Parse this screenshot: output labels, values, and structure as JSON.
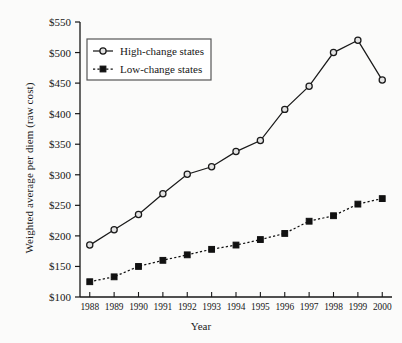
{
  "chart_data": {
    "type": "line",
    "title": "",
    "xlabel": "Year",
    "ylabel": "Weighted average per diem (raw cost)",
    "x": [
      1988,
      1989,
      1990,
      1991,
      1992,
      1993,
      1994,
      1995,
      1996,
      1997,
      1998,
      1999,
      2000
    ],
    "categories": [
      "1988",
      "1989",
      "1990",
      "1991",
      "1992",
      "1993",
      "1994",
      "1995",
      "1996",
      "1997",
      "1998",
      "1999",
      "2000"
    ],
    "series": [
      {
        "name": "High-change states",
        "values": [
          185,
          210,
          235,
          269,
          301,
          313,
          338,
          356,
          407,
          445,
          500,
          520,
          455
        ],
        "marker": "open-circle",
        "linestyle": "solid",
        "color": "#1a1a1a"
      },
      {
        "name": "Low-change states",
        "values": [
          125,
          133,
          150,
          160,
          169,
          178,
          185,
          194,
          204,
          224,
          233,
          252,
          261
        ],
        "marker": "filled-square",
        "linestyle": "dashed",
        "color": "#111111"
      }
    ],
    "ylim": [
      100,
      550
    ],
    "ytick_values": [
      100,
      150,
      200,
      250,
      300,
      350,
      400,
      450,
      500,
      550
    ],
    "ytick_labels": [
      "$100",
      "$150",
      "$200",
      "$250",
      "$300",
      "$350",
      "$400",
      "$450",
      "$500",
      "$550"
    ],
    "xlim": [
      1987.6,
      2000.4
    ],
    "grid": false,
    "legend_position": "upper-left"
  },
  "legend": {
    "entries": [
      {
        "label": "High-change states"
      },
      {
        "label": "Low-change states"
      }
    ]
  },
  "axes": {
    "x_title": "Year",
    "y_title": "Weighted average per diem (raw cost)"
  },
  "colors": {
    "line": "#1a1a1a",
    "axis": "#171717",
    "background": "#fbfbfa",
    "legend_border": "#555555"
  }
}
